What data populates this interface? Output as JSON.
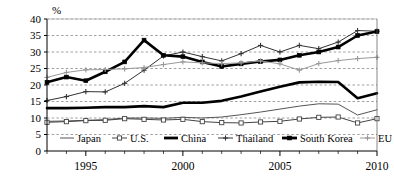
{
  "chart_data": {
    "type": "line",
    "title": "",
    "subtitle": "",
    "xlabel": "",
    "ylabel": "",
    "unit_label": "%",
    "xlim": [
      1993,
      2010
    ],
    "ylim": [
      0,
      40
    ],
    "yticks": [
      0,
      5,
      10,
      15,
      20,
      25,
      30,
      35,
      40
    ],
    "ytick_labels": [
      "0",
      "5",
      "10",
      "15",
      "20",
      "25",
      "30",
      "35",
      "40"
    ],
    "xticks": [
      1995,
      2000,
      2005,
      2010
    ],
    "xtick_labels": [
      "1995",
      "2000",
      "2005",
      "2010"
    ],
    "x": [
      1993,
      1994,
      1995,
      1996,
      1997,
      1998,
      1999,
      2000,
      2001,
      2002,
      2003,
      2004,
      2005,
      2006,
      2007,
      2008,
      2009,
      2010
    ],
    "grid": "horizontal-dashed",
    "legend_position": "inside-bottom",
    "series": [
      {
        "name": "Japan",
        "marker": "none",
        "style": "thin-line",
        "color": "#555555",
        "values": [
          9.0,
          9.1,
          9.3,
          9.5,
          10.0,
          10.0,
          9.9,
          10.2,
          10.0,
          10.3,
          11.0,
          11.8,
          12.7,
          13.6,
          14.3,
          14.2,
          10.9,
          12.5
        ]
      },
      {
        "name": "U.S.",
        "marker": "open-square",
        "style": "thin-line",
        "color": "#444444",
        "values": [
          8.7,
          8.9,
          9.2,
          9.3,
          9.8,
          9.6,
          9.4,
          9.6,
          8.9,
          8.6,
          8.5,
          8.8,
          9.0,
          9.7,
          10.2,
          10.3,
          8.5,
          9.8
        ]
      },
      {
        "name": "China",
        "marker": "none",
        "style": "thick-line",
        "color": "#000000",
        "values": [
          13.0,
          13.0,
          13.1,
          13.3,
          13.3,
          13.6,
          13.3,
          14.6,
          14.6,
          15.2,
          16.5,
          18.0,
          19.5,
          20.8,
          21.0,
          20.9,
          16.0,
          17.5
        ]
      },
      {
        "name": "Thailand",
        "marker": "plus",
        "style": "thin-line",
        "color": "#333333",
        "values": [
          15.3,
          16.5,
          18.0,
          17.9,
          20.5,
          24.5,
          28.8,
          30.0,
          28.6,
          27.3,
          29.5,
          32.0,
          30.0,
          32.0,
          31.0,
          33.0,
          36.5,
          36.3
        ]
      },
      {
        "name": "South Korea",
        "marker": "filled-square",
        "style": "thick-line",
        "color": "#000000",
        "values": [
          20.8,
          22.4,
          21.3,
          24.0,
          27.0,
          33.6,
          29.0,
          28.6,
          27.0,
          25.6,
          26.4,
          27.1,
          27.6,
          29.0,
          30.0,
          31.5,
          35.0,
          36.2
        ]
      },
      {
        "name": "EU",
        "marker": "plus-gray",
        "style": "thin-line",
        "color": "#999999",
        "values": [
          22.3,
          23.8,
          24.6,
          24.7,
          24.9,
          25.3,
          26.2,
          27.0,
          26.7,
          26.5,
          26.7,
          27.3,
          26.4,
          24.5,
          26.5,
          27.4,
          28.0,
          28.4
        ]
      }
    ]
  },
  "legend": {
    "items": [
      {
        "label": "Japan"
      },
      {
        "label": "U.S."
      },
      {
        "label": "China"
      },
      {
        "label": "Thailand"
      },
      {
        "label": "South Korea"
      },
      {
        "label": "EU"
      }
    ]
  }
}
